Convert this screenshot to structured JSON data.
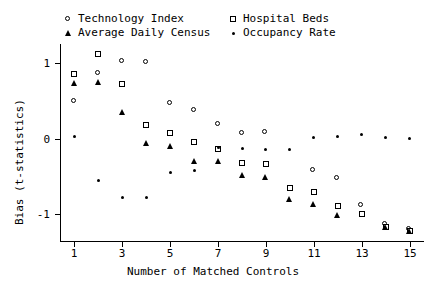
{
  "chart_data": {
    "type": "scatter",
    "title": "",
    "xlabel": "Number of Matched Controls",
    "ylabel": "Bias (t-statistics)",
    "xlim": [
      0.4,
      15.6
    ],
    "ylim": [
      -1.35,
      1.25
    ],
    "xticks": [
      1,
      3,
      5,
      7,
      9,
      11,
      13,
      15
    ],
    "xticklabels": [
      "1",
      "3",
      "5",
      "7",
      "9",
      "11",
      "13",
      "15"
    ],
    "yticks": [
      1,
      0,
      -1
    ],
    "yticklabels": [
      "1",
      "0",
      "-1"
    ],
    "grid": false,
    "legend_position": "top",
    "x": [
      1,
      2,
      3,
      4,
      5,
      6,
      7,
      8,
      9,
      10,
      11,
      12,
      13,
      14,
      15
    ],
    "series": [
      {
        "name": "Technology Index",
        "marker": "circle",
        "values": [
          0.49,
          0.86,
          1.02,
          1.0,
          0.47,
          0.37,
          0.19,
          0.07,
          0.08,
          null,
          -0.42,
          -0.52,
          -0.88,
          -1.13,
          -1.2
        ]
      },
      {
        "name": "Hospital Beds",
        "marker": "square",
        "values": [
          0.85,
          1.12,
          0.72,
          0.18,
          0.08,
          -0.04,
          -0.13,
          -0.32,
          -0.33,
          -0.65,
          -0.7,
          -0.89,
          -1.0,
          -1.16,
          -1.22
        ]
      },
      {
        "name": "Average Daily Census",
        "marker": "triangle",
        "values": [
          0.74,
          0.75,
          0.35,
          -0.06,
          -0.09,
          -0.3,
          -0.29,
          -0.48,
          -0.5,
          -0.8,
          -0.86,
          -1.01,
          null,
          -1.17,
          -1.22
        ]
      },
      {
        "name": "Occupancy Rate",
        "marker": "dot",
        "values": [
          0.03,
          -0.55,
          -0.78,
          -0.78,
          -0.44,
          -0.42,
          -0.11,
          -0.13,
          -0.14,
          -0.14,
          0.02,
          0.03,
          0.05,
          0.01,
          0.0
        ]
      }
    ]
  },
  "legend": {
    "entries": [
      {
        "label": "Technology Index",
        "marker": "circle"
      },
      {
        "label": "Hospital Beds",
        "marker": "square"
      },
      {
        "label": "Average Daily Census",
        "marker": "triangle"
      },
      {
        "label": "Occupancy Rate",
        "marker": "dot"
      }
    ]
  }
}
